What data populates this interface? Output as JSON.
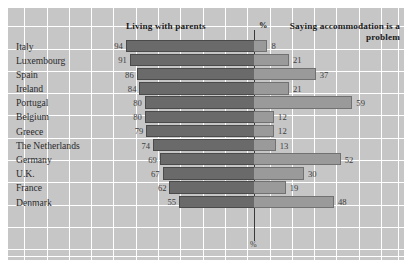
{
  "header": {
    "left_title": "Living with parents",
    "percent_symbol": "%",
    "right_title": "Saying accommodation is a problem"
  },
  "axis": {
    "bottom_label": "%"
  },
  "colors": {
    "background": "#c6c6c6",
    "grid": "#ffffff",
    "bar_left": "#6a6a6a",
    "bar_right": "#9a9a9a",
    "axis_line": "#3a3a3a",
    "text": "#2b2b2b"
  },
  "chart_data": {
    "type": "bar",
    "title": "",
    "subtitle": "",
    "xlabel": "%",
    "ylabel": "",
    "orientation": "horizontal",
    "layout": "diverging-back-to-back",
    "grid": true,
    "legend_position": "top",
    "categories": [
      "Italy",
      "Luxembourg",
      "Spain",
      "Ireland",
      "Portugal",
      "Belgium",
      "Greece",
      "The Netherlands",
      "Germany",
      "U.K.",
      "France",
      "Denmark"
    ],
    "series": [
      {
        "name": "Living with parents",
        "direction": "left",
        "values": [
          94,
          91,
          86,
          84,
          80,
          80,
          79,
          74,
          69,
          67,
          62,
          55
        ]
      },
      {
        "name": "Saying accommodation is a problem",
        "direction": "right",
        "values": [
          8,
          21,
          37,
          21,
          59,
          12,
          12,
          13,
          52,
          30,
          19,
          48
        ]
      }
    ],
    "xlim_left": [
      0,
      100
    ],
    "xlim_right": [
      0,
      90
    ]
  }
}
